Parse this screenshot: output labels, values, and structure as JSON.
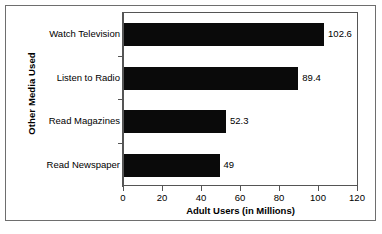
{
  "chart_data": {
    "type": "bar",
    "orientation": "horizontal",
    "title": "",
    "xlabel": "Adult Users (in Millions)",
    "ylabel": "Other Media Used",
    "categories": [
      "Watch Television",
      "Listen to Radio",
      "Read Magazines",
      "Read Newspaper"
    ],
    "values": [
      102.6,
      89.4,
      52.3,
      49
    ],
    "value_labels": [
      "102.6",
      "89.4",
      "52.3",
      "49"
    ],
    "xlim": [
      0,
      120
    ],
    "xticks": [
      0,
      20,
      40,
      60,
      80,
      100,
      120
    ],
    "xtick_labels": [
      "0",
      "20",
      "40",
      "60",
      "80",
      "100",
      "120"
    ],
    "grid": false,
    "legend": false,
    "series": [
      {
        "name": "Adult Users (in Millions)",
        "values": [
          102.6,
          89.4,
          52.3,
          49
        ]
      }
    ],
    "colors": {
      "bar": "#0a0a0a",
      "axis": "#555555",
      "frame": "#6e6e6e",
      "background": "#ffffff",
      "text": "#000000"
    }
  }
}
